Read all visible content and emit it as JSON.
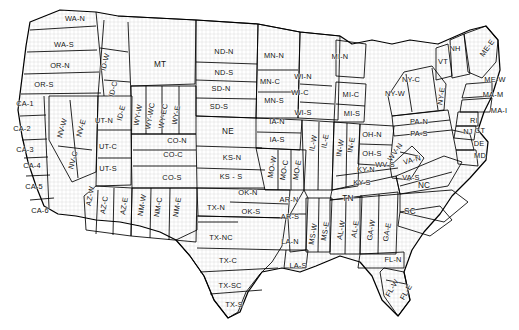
{
  "map": {
    "title": "US Climate Division Regions Map",
    "description": "Outline map of the contiguous United States divided into sub-state forecast regions, each annotated with a state abbreviation and a directional sub-region suffix.",
    "colors": {
      "background": "#ffffff",
      "outline": "#000000",
      "county_lines": "#b0b0b0",
      "label_text": "#111111"
    },
    "regions": [
      {
        "code": "WA-N",
        "x": 75,
        "y": 18,
        "rot": 0
      },
      {
        "code": "WA-S",
        "x": 64,
        "y": 44,
        "rot": 0
      },
      {
        "code": "OR-N",
        "x": 60,
        "y": 65,
        "rot": 0
      },
      {
        "code": "OR-S",
        "x": 44,
        "y": 84,
        "rot": 0
      },
      {
        "code": "ID-W",
        "x": 105,
        "y": 62,
        "rot": -75
      },
      {
        "code": "ID-C",
        "x": 113,
        "y": 89,
        "rot": -75
      },
      {
        "code": "ID-E",
        "x": 121,
        "y": 113,
        "rot": -75
      },
      {
        "code": "MT",
        "x": 160,
        "y": 64,
        "rot": 0,
        "big": true
      },
      {
        "code": "WY-W",
        "x": 138,
        "y": 115,
        "rot": -80
      },
      {
        "code": "WY-WC",
        "x": 150,
        "y": 116,
        "rot": -80
      },
      {
        "code": "WY-EC",
        "x": 163,
        "y": 116,
        "rot": -80
      },
      {
        "code": "WY-E",
        "x": 176,
        "y": 115,
        "rot": -80
      },
      {
        "code": "CO-N",
        "x": 177,
        "y": 140,
        "rot": 0
      },
      {
        "code": "CO-C",
        "x": 173,
        "y": 154,
        "rot": 0
      },
      {
        "code": "CO-S",
        "x": 172,
        "y": 177,
        "rot": 0
      },
      {
        "code": "UT-N",
        "x": 104,
        "y": 120,
        "rot": 0
      },
      {
        "code": "UT-C",
        "x": 108,
        "y": 146,
        "rot": 0
      },
      {
        "code": "UT-S",
        "x": 108,
        "y": 168,
        "rot": 0
      },
      {
        "code": "NV-W",
        "x": 62,
        "y": 128,
        "rot": -75
      },
      {
        "code": "NV-E",
        "x": 81,
        "y": 128,
        "rot": -75
      },
      {
        "code": "NV-C",
        "x": 73,
        "y": 160,
        "rot": -75
      },
      {
        "code": "CA-1",
        "x": 25,
        "y": 103,
        "rot": 0
      },
      {
        "code": "CA-2",
        "x": 22,
        "y": 128,
        "rot": 0
      },
      {
        "code": "CA-3",
        "x": 25,
        "y": 149,
        "rot": 0
      },
      {
        "code": "CA-4",
        "x": 32,
        "y": 165,
        "rot": 0
      },
      {
        "code": "CA-5",
        "x": 34,
        "y": 186,
        "rot": 0
      },
      {
        "code": "CA-6",
        "x": 40,
        "y": 210,
        "rot": 0
      },
      {
        "code": "AZ-W",
        "x": 90,
        "y": 196,
        "rot": -80
      },
      {
        "code": "AZ-C",
        "x": 104,
        "y": 205,
        "rot": -80
      },
      {
        "code": "AZ-E",
        "x": 124,
        "y": 206,
        "rot": -80
      },
      {
        "code": "NM-W",
        "x": 142,
        "y": 205,
        "rot": -80
      },
      {
        "code": "NM-C",
        "x": 158,
        "y": 207,
        "rot": -80
      },
      {
        "code": "NM-E",
        "x": 177,
        "y": 207,
        "rot": -80
      },
      {
        "code": "ND-N",
        "x": 224,
        "y": 51,
        "rot": 0
      },
      {
        "code": "ND-S",
        "x": 224,
        "y": 72,
        "rot": 0
      },
      {
        "code": "SD-N",
        "x": 221,
        "y": 88,
        "rot": 0
      },
      {
        "code": "SD-S",
        "x": 219,
        "y": 106,
        "rot": 0
      },
      {
        "code": "NE",
        "x": 228,
        "y": 131,
        "rot": 0,
        "big": true
      },
      {
        "code": "KS-N",
        "x": 232,
        "y": 157,
        "rot": 0
      },
      {
        "code": "KS - S",
        "x": 231,
        "y": 176,
        "rot": 0
      },
      {
        "code": "OK-N",
        "x": 248,
        "y": 192,
        "rot": 0
      },
      {
        "code": "OK-S",
        "x": 251,
        "y": 211,
        "rot": 0
      },
      {
        "code": "TX-N",
        "x": 216,
        "y": 207,
        "rot": 0
      },
      {
        "code": "TX-NC",
        "x": 221,
        "y": 237,
        "rot": 0
      },
      {
        "code": "TX-C",
        "x": 228,
        "y": 260,
        "rot": 0
      },
      {
        "code": "TX-SC",
        "x": 230,
        "y": 285,
        "rot": 0
      },
      {
        "code": "TX-S",
        "x": 234,
        "y": 304,
        "rot": 0
      },
      {
        "code": "MN-N",
        "x": 274,
        "y": 55,
        "rot": 0
      },
      {
        "code": "MN-C",
        "x": 270,
        "y": 81,
        "rot": 0
      },
      {
        "code": "MN-S",
        "x": 274,
        "y": 100,
        "rot": 0
      },
      {
        "code": "IA-N",
        "x": 277,
        "y": 121,
        "rot": 0
      },
      {
        "code": "IA-S",
        "x": 277,
        "y": 139,
        "rot": 0
      },
      {
        "code": "MO-W",
        "x": 272,
        "y": 167,
        "rot": -80
      },
      {
        "code": "MO-C",
        "x": 284,
        "y": 170,
        "rot": -80
      },
      {
        "code": "MO-E",
        "x": 297,
        "y": 170,
        "rot": -80
      },
      {
        "code": "WI-N",
        "x": 303,
        "y": 76,
        "rot": 0
      },
      {
        "code": "WI-C",
        "x": 300,
        "y": 92,
        "rot": 0
      },
      {
        "code": "WI-S",
        "x": 303,
        "y": 112,
        "rot": 0
      },
      {
        "code": "MI-N",
        "x": 340,
        "y": 56,
        "rot": 0
      },
      {
        "code": "MI-C",
        "x": 351,
        "y": 94,
        "rot": 0
      },
      {
        "code": "MI-S",
        "x": 352,
        "y": 113,
        "rot": 0
      },
      {
        "code": "IL-W",
        "x": 313,
        "y": 143,
        "rot": -80
      },
      {
        "code": "IL-E",
        "x": 325,
        "y": 141,
        "rot": -80
      },
      {
        "code": "IN-W",
        "x": 340,
        "y": 148,
        "rot": -80
      },
      {
        "code": "IN-E",
        "x": 351,
        "y": 145,
        "rot": -80
      },
      {
        "code": "OH-N",
        "x": 372,
        "y": 134,
        "rot": 0
      },
      {
        "code": "OH-S",
        "x": 372,
        "y": 153,
        "rot": 0
      },
      {
        "code": "WV-N",
        "x": 395,
        "y": 152,
        "rot": -55
      },
      {
        "code": "WV-S",
        "x": 385,
        "y": 164,
        "rot": 0
      },
      {
        "code": "KY-N",
        "x": 366,
        "y": 169,
        "rot": 0
      },
      {
        "code": "KY-S",
        "x": 362,
        "y": 182,
        "rot": 0
      },
      {
        "code": "TN",
        "x": 348,
        "y": 198,
        "rot": 0,
        "big": true
      },
      {
        "code": "AR-N",
        "x": 289,
        "y": 199,
        "rot": 0
      },
      {
        "code": "AR-S",
        "x": 290,
        "y": 216,
        "rot": 0
      },
      {
        "code": "LA-N",
        "x": 290,
        "y": 241,
        "rot": 0
      },
      {
        "code": "LA-S",
        "x": 298,
        "y": 265,
        "rot": 0
      },
      {
        "code": "MS-W",
        "x": 313,
        "y": 234,
        "rot": -80
      },
      {
        "code": "MS-E",
        "x": 325,
        "y": 231,
        "rot": -80
      },
      {
        "code": "AL-W",
        "x": 341,
        "y": 230,
        "rot": -80
      },
      {
        "code": "AL-E",
        "x": 355,
        "y": 229,
        "rot": -80
      },
      {
        "code": "GA-W",
        "x": 371,
        "y": 230,
        "rot": -80
      },
      {
        "code": "GA-E",
        "x": 387,
        "y": 232,
        "rot": -80
      },
      {
        "code": "SC",
        "x": 410,
        "y": 211,
        "rot": 0,
        "big": true
      },
      {
        "code": "NC",
        "x": 424,
        "y": 185,
        "rot": 0,
        "big": true
      },
      {
        "code": "FL-N",
        "x": 393,
        "y": 259,
        "rot": 0
      },
      {
        "code": "FL-W",
        "x": 392,
        "y": 288,
        "rot": -60
      },
      {
        "code": "FL-E",
        "x": 406,
        "y": 292,
        "rot": -60
      },
      {
        "code": "VA-N",
        "x": 412,
        "y": 160,
        "rot": -15
      },
      {
        "code": "VA-S",
        "x": 411,
        "y": 177,
        "rot": 0
      },
      {
        "code": "MD",
        "x": 480,
        "y": 155,
        "rot": 0
      },
      {
        "code": "DE",
        "x": 479,
        "y": 143,
        "rot": 0
      },
      {
        "code": "NJ",
        "x": 468,
        "y": 131,
        "rot": 0
      },
      {
        "code": "PA-N",
        "x": 419,
        "y": 121,
        "rot": 0
      },
      {
        "code": "PA-S",
        "x": 419,
        "y": 133,
        "rot": 0
      },
      {
        "code": "NY-W",
        "x": 395,
        "y": 93,
        "rot": 0
      },
      {
        "code": "NY-C",
        "x": 411,
        "y": 79,
        "rot": 0
      },
      {
        "code": "NY-E",
        "x": 441,
        "y": 96,
        "rot": -80
      },
      {
        "code": "VT",
        "x": 443,
        "y": 61,
        "rot": 0
      },
      {
        "code": "NH",
        "x": 455,
        "y": 48,
        "rot": 0
      },
      {
        "code": "ME-E",
        "x": 487,
        "y": 48,
        "rot": -55
      },
      {
        "code": "ME-W",
        "x": 495,
        "y": 79,
        "rot": 0
      },
      {
        "code": "MA-M",
        "x": 493,
        "y": 94,
        "rot": 0
      },
      {
        "code": "MA-I",
        "x": 499,
        "y": 110,
        "rot": 0
      },
      {
        "code": "RI",
        "x": 474,
        "y": 120,
        "rot": 0
      },
      {
        "code": "CT",
        "x": 480,
        "y": 130,
        "rot": 0
      }
    ]
  }
}
